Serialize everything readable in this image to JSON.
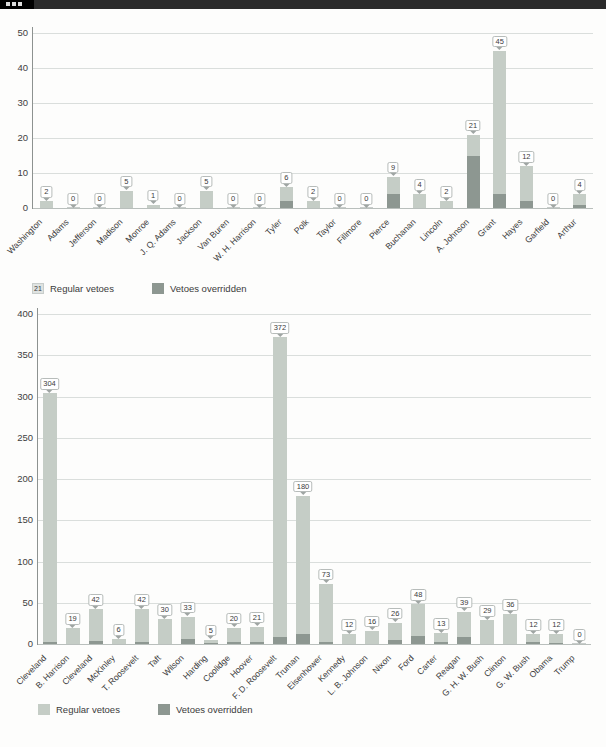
{
  "window": {
    "strip_color": "#2b2b2b"
  },
  "legend": {
    "regular_label": "Regular vetoes",
    "override_label": "Vetoes overridden",
    "sample_value": "21",
    "regular_color": "#c5cdc6",
    "override_color": "#8d9791"
  },
  "chart_data": [
    {
      "id": "chart1",
      "type": "bar",
      "stacked": true,
      "title": "",
      "xlabel": "",
      "ylabel": "",
      "ylim": [
        0,
        50
      ],
      "yticks": [
        "0",
        "10",
        "20",
        "30",
        "40",
        "50"
      ],
      "grid": true,
      "legend_position": "bottom-left",
      "categories": [
        "Washington",
        "Adams",
        "Jefferson",
        "Madison",
        "Monroe",
        "J. Q. Adams",
        "Jackson",
        "Van Buren",
        "W. H. Harrison",
        "Tyler",
        "Polk",
        "Taylor",
        "Fillmore",
        "Pierce",
        "Buchanan",
        "Lincoln",
        "A. Johnson",
        "Grant",
        "Hayes",
        "Garfield",
        "Arthur"
      ],
      "labels": [
        "2",
        "0",
        "0",
        "5",
        "1",
        "0",
        "5",
        "0",
        "0",
        "6",
        "2",
        "0",
        "0",
        "9",
        "4",
        "2",
        "21",
        "45",
        "12",
        "0",
        "4"
      ],
      "series": [
        {
          "name": "Regular vetoes",
          "values": [
            2,
            0,
            0,
            5,
            1,
            0,
            5,
            0,
            0,
            4,
            2,
            0,
            0,
            5,
            4,
            2,
            6,
            41,
            10,
            0,
            3
          ]
        },
        {
          "name": "Vetoes overridden",
          "values": [
            0,
            0,
            0,
            0,
            0,
            0,
            0,
            0,
            0,
            2,
            0,
            0,
            0,
            4,
            0,
            0,
            15,
            4,
            2,
            0,
            1
          ]
        }
      ]
    },
    {
      "id": "chart2",
      "type": "bar",
      "stacked": true,
      "title": "",
      "xlabel": "",
      "ylabel": "",
      "ylim": [
        0,
        400
      ],
      "yticks": [
        "0",
        "50",
        "100",
        "150",
        "200",
        "250",
        "300",
        "350",
        "400"
      ],
      "grid": true,
      "legend_position": "bottom-left",
      "categories": [
        "Cleveland",
        "B. Harrison",
        "Cleveland",
        "McKinley",
        "T. Roosevelt",
        "Taft",
        "Wilson",
        "Harding",
        "Coolidge",
        "Hoover",
        "F. D. Roosevelt",
        "Truman",
        "Eisenhower",
        "Kennedy",
        "L. B. Johnson",
        "Nixon",
        "Ford",
        "Carter",
        "Reagan",
        "G. H. W. Bush",
        "Clinton",
        "G. W. Bush",
        "Obama",
        "Trump"
      ],
      "labels": [
        "304",
        "19",
        "42",
        "6",
        "42",
        "30",
        "33",
        "5",
        "20",
        "21",
        "372",
        "180",
        "73",
        "12",
        "16",
        "26",
        "48",
        "13",
        "39",
        "29",
        "36",
        "12",
        "12",
        "0"
      ],
      "series": [
        {
          "name": "Regular vetoes",
          "values": [
            302,
            19,
            38,
            6,
            40,
            30,
            27,
            4,
            18,
            18,
            363,
            168,
            71,
            12,
            16,
            21,
            38,
            11,
            30,
            29,
            36,
            9,
            11,
            0
          ]
        },
        {
          "name": "Vetoes overridden",
          "values": [
            2,
            0,
            4,
            0,
            2,
            0,
            6,
            1,
            2,
            3,
            9,
            12,
            2,
            0,
            0,
            5,
            10,
            2,
            9,
            0,
            0,
            3,
            1,
            0
          ]
        }
      ]
    }
  ]
}
